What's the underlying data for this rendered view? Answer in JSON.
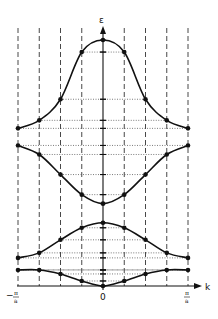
{
  "diagram": {
    "y_axis_label": "ε",
    "x_axis_label": "k",
    "x_ticks": [
      {
        "label_num": "π",
        "label_den": "a",
        "sign": "−",
        "pos": "left"
      },
      {
        "label": "0",
        "pos": "center"
      },
      {
        "label_num": "π",
        "label_den": "a",
        "sign": "",
        "pos": "right"
      }
    ],
    "colors": {
      "line": "#111111",
      "grid": "#333333",
      "background": "#ffffff"
    }
  },
  "chart_data": {
    "type": "line",
    "title": "",
    "xlabel": "k",
    "ylabel": "ε",
    "xlim": [
      "-π/a",
      "π/a"
    ],
    "x": [
      -4,
      -3,
      -2,
      -1,
      0,
      1,
      2,
      3,
      4
    ],
    "x_note": "x in units of π/(4a); dashed vertical lines at each sample k",
    "series": [
      {
        "name": "band-1",
        "values": [
          0.16,
          0.16,
          0.12,
          0.05,
          0.0,
          0.05,
          0.12,
          0.16,
          0.16
        ]
      },
      {
        "name": "band-2",
        "values": [
          0.28,
          0.33,
          0.46,
          0.58,
          0.63,
          0.58,
          0.46,
          0.33,
          0.28
        ]
      },
      {
        "name": "band-3",
        "values": [
          1.4,
          1.31,
          1.11,
          0.91,
          0.82,
          0.91,
          1.11,
          1.31,
          1.4
        ]
      },
      {
        "name": "band-4",
        "values": [
          1.57,
          1.65,
          1.86,
          2.33,
          2.45,
          2.33,
          1.86,
          1.65,
          1.57
        ]
      }
    ],
    "grid": "dashed vertical lines at sample k; dotted horizontal lines from points to ε axis",
    "legend": "none"
  }
}
